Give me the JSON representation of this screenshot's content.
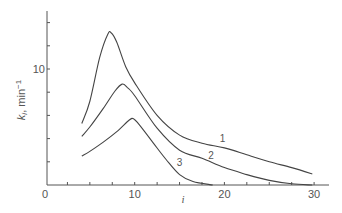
{
  "chart_data": {
    "type": "line",
    "title": "",
    "xlabel": "i",
    "ylabel": "k_i, min⁻¹",
    "ylabel_display": {
      "k": "k",
      "sub": "i",
      "rest": ", min",
      "sup": "−1"
    },
    "xlim": [
      0,
      31.5
    ],
    "ylim": [
      0,
      15
    ],
    "x_ticks": [
      0,
      2.5,
      5,
      7.5,
      10,
      12.5,
      15,
      17.5,
      20,
      22.5,
      25,
      27.5,
      30
    ],
    "x_tick_labels": [
      {
        "value": 0,
        "label": "0"
      },
      {
        "value": 10,
        "label": "10"
      },
      {
        "value": 20,
        "label": "20"
      },
      {
        "value": 30,
        "label": "30"
      }
    ],
    "y_ticks": [
      2,
      4,
      6,
      8,
      10,
      12,
      14
    ],
    "y_tick_labels": [
      {
        "value": 10,
        "label": "10"
      }
    ],
    "grid": false,
    "legend": "inline curve labels",
    "series": [
      {
        "name": "1",
        "label_pos": {
          "x": 19.8,
          "y": 3.7
        },
        "points": [
          [
            4.1,
            5.3
          ],
          [
            5,
            7.2
          ],
          [
            6.1,
            11.0
          ],
          [
            7.0,
            13.0
          ],
          [
            7.4,
            13.1
          ],
          [
            8.0,
            12.3
          ],
          [
            9.0,
            10.2
          ],
          [
            10,
            8.8
          ],
          [
            12.5,
            6.0
          ],
          [
            15,
            4.3
          ],
          [
            17.5,
            3.6
          ],
          [
            20,
            3.2
          ],
          [
            22.5,
            2.6
          ],
          [
            25,
            2.0
          ],
          [
            27.5,
            1.5
          ],
          [
            29.8,
            0.95
          ]
        ]
      },
      {
        "name": "2",
        "label_pos": {
          "x": 18.5,
          "y": 2.2
        },
        "points": [
          [
            4.1,
            4.2
          ],
          [
            5,
            5.0
          ],
          [
            6.5,
            6.6
          ],
          [
            7.8,
            8.1
          ],
          [
            8.6,
            8.7
          ],
          [
            9.2,
            8.4
          ],
          [
            10,
            7.7
          ],
          [
            12.5,
            4.9
          ],
          [
            15,
            3.0
          ],
          [
            17.5,
            2.3
          ],
          [
            20,
            1.5
          ],
          [
            22.5,
            0.9
          ],
          [
            25,
            0.4
          ],
          [
            27.5,
            0.1
          ],
          [
            29.8,
            0.0
          ]
        ]
      },
      {
        "name": "3",
        "label_pos": {
          "x": 15.0,
          "y": 1.6
        },
        "points": [
          [
            4.1,
            2.5
          ],
          [
            5,
            2.9
          ],
          [
            6.5,
            3.7
          ],
          [
            8,
            4.6
          ],
          [
            9.4,
            5.6
          ],
          [
            9.9,
            5.7
          ],
          [
            10.5,
            5.2
          ],
          [
            12,
            3.7
          ],
          [
            13.5,
            2.2
          ],
          [
            15,
            0.9
          ],
          [
            16.5,
            0.3
          ],
          [
            18.7,
            0.0
          ]
        ]
      }
    ]
  }
}
